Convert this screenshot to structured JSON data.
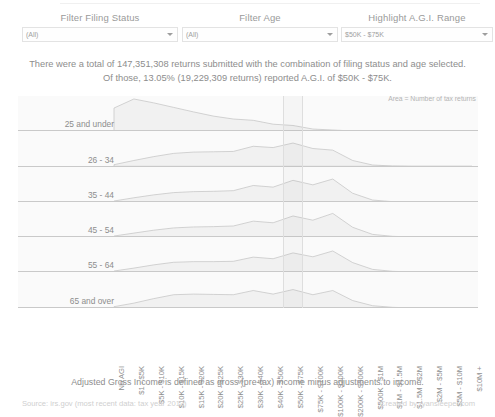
{
  "filters": [
    {
      "id": "filing-status",
      "label": "Filter Filing Status",
      "value": "(All)"
    },
    {
      "id": "age",
      "label": "Filter Age",
      "value": "(All)"
    },
    {
      "id": "agi-range",
      "label": "Highlight A.G.I. Range",
      "value": "$50K - $75K"
    }
  ],
  "headline": {
    "line1": "There were a total of 147,351,308 returns submitted with the combination of filing status and age selected.",
    "line2": "Of those, 13.05% (19,229,309 returns) reported A.G.I. of $50K - $75K."
  },
  "chart_note": "Area = Number of tax returns",
  "definition": "Adjusted Gross Income is defined as gross (pre-tax) income minus adjustments to income.",
  "footer": {
    "source": "Source: irs.gov (most recent data: tax year 2013)",
    "credit": "Created by ryansleeper.com"
  },
  "chart_data": {
    "type": "area",
    "title": "",
    "subtitle": "",
    "xlabel": "",
    "ylabel": "Number of tax returns",
    "grid": false,
    "legend": "none",
    "highlight_category": "$50K - $75K",
    "categories": [
      "No AGI",
      "$1 - $5K",
      "$5K - $10K",
      "$10K - $15K",
      "$15K - $20K",
      "$20K - $25K",
      "$25K - $30K",
      "$30K - $40K",
      "$40K - $50K",
      "$50K - $75K",
      "$75K - $100K",
      "$100K - $200K",
      "$200K - $500K",
      "$500K - $1M",
      "$1M - $1.5M",
      "$1.5M - $2M",
      "$2M - $5M",
      "$5M - $10M",
      "$10M +"
    ],
    "series": [
      {
        "name": "25 and under",
        "values": [
          0.72,
          1.0,
          0.88,
          0.74,
          0.6,
          0.47,
          0.38,
          0.34,
          0.22,
          0.18,
          0.07,
          0.04,
          0.01,
          0.0,
          0.0,
          0.0,
          0.0,
          0.0,
          0.0
        ]
      },
      {
        "name": "26 - 34",
        "values": [
          0.05,
          0.18,
          0.3,
          0.4,
          0.44,
          0.45,
          0.46,
          0.62,
          0.58,
          0.72,
          0.55,
          0.5,
          0.18,
          0.04,
          0.01,
          0.0,
          0.0,
          0.0,
          0.0
        ]
      },
      {
        "name": "35 - 44",
        "values": [
          0.04,
          0.14,
          0.23,
          0.3,
          0.33,
          0.34,
          0.36,
          0.52,
          0.47,
          0.68,
          0.54,
          0.72,
          0.28,
          0.07,
          0.02,
          0.01,
          0.01,
          0.0,
          0.0
        ]
      },
      {
        "name": "45 - 54",
        "values": [
          0.04,
          0.13,
          0.22,
          0.29,
          0.32,
          0.33,
          0.35,
          0.5,
          0.45,
          0.66,
          0.53,
          0.74,
          0.31,
          0.09,
          0.03,
          0.01,
          0.01,
          0.0,
          0.0
        ]
      },
      {
        "name": "55 - 64",
        "values": [
          0.04,
          0.13,
          0.23,
          0.31,
          0.33,
          0.33,
          0.34,
          0.47,
          0.42,
          0.6,
          0.48,
          0.66,
          0.3,
          0.09,
          0.03,
          0.01,
          0.01,
          0.0,
          0.0
        ]
      },
      {
        "name": "65 and over",
        "values": [
          0.05,
          0.16,
          0.3,
          0.42,
          0.44,
          0.43,
          0.42,
          0.55,
          0.44,
          0.58,
          0.42,
          0.55,
          0.24,
          0.08,
          0.03,
          0.01,
          0.01,
          0.0,
          0.0
        ]
      }
    ],
    "colors": {
      "area_fill": "#f1f1f1",
      "area_line": "#c2c2c2",
      "baseline": "#c9c9c9",
      "panel_bg": "#fafafa"
    }
  }
}
